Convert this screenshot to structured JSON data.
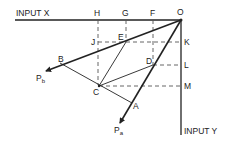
{
  "diagram": {
    "axes": {
      "x_label": "INPUT X",
      "y_label": "INPUT Y"
    },
    "points": {
      "O": "O",
      "H": "H",
      "G": "G",
      "F": "F",
      "K": "K",
      "L": "L",
      "M": "M",
      "J": "J",
      "E": "E",
      "D": "D",
      "C": "C",
      "B": "B",
      "A": "A"
    },
    "vectors": {
      "pa_main": "P",
      "pa_sub": "a",
      "pb_main": "P",
      "pb_sub": "b"
    },
    "colors": {
      "line": "#222222",
      "dashed": "#555555"
    }
  }
}
